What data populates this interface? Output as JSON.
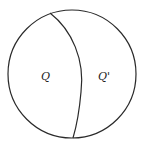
{
  "diagram": {
    "type": "sphere-partition",
    "colors": {
      "stroke": "#2a2a2a",
      "background": "#ffffff"
    },
    "regions": [
      {
        "id": "left",
        "label": "Q"
      },
      {
        "id": "right",
        "label": "Q'"
      }
    ]
  }
}
